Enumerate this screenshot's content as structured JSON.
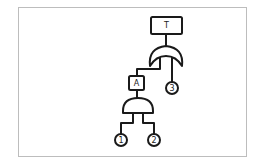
{
  "diagram": {
    "type": "fault-tree",
    "top_event": {
      "label": "T"
    },
    "gates": [
      {
        "id": "or-gate",
        "kind": "OR",
        "parent": "T",
        "inputs": [
          "A",
          "3"
        ]
      },
      {
        "id": "and-gate",
        "kind": "AND",
        "parent": "A",
        "inputs": [
          "1",
          "2"
        ]
      }
    ],
    "intermediate_event": {
      "label": "A"
    },
    "basic_events": [
      {
        "label": "1"
      },
      {
        "label": "2"
      },
      {
        "label": "3"
      }
    ],
    "colors": {
      "stroke": "#1a1a1a",
      "frame": "#bdbdbd",
      "background": "#ffffff"
    }
  }
}
